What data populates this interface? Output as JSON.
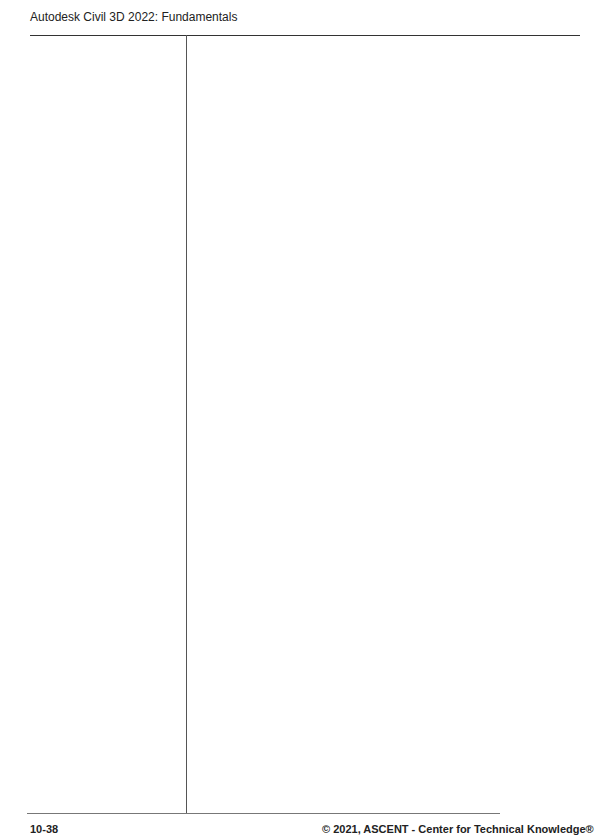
{
  "header": {
    "title": "Autodesk Civil 3D 2022: Fundamentals"
  },
  "layout": {
    "rule_color": "#333333",
    "background": "#ffffff"
  },
  "sidebar": {
    "content": ""
  },
  "main": {
    "content": ""
  },
  "footer": {
    "page_number": "10-38",
    "copyright": "© 2021, ASCENT - Center for Technical Knowledge®"
  }
}
